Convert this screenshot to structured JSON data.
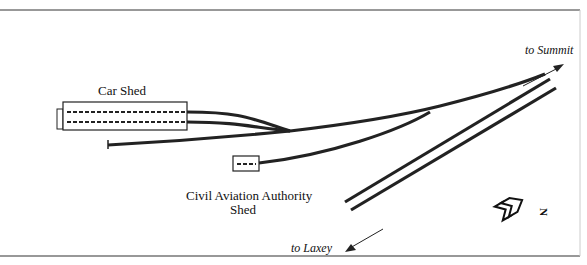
{
  "labels": {
    "car_shed": "Car Shed",
    "caa_shed_line1": "Civil Aviation Authority",
    "caa_shed_line2": "Shed",
    "to_summit": "to Summit",
    "to_laxey": "to Laxey",
    "north": "N"
  },
  "colors": {
    "track": "#222222",
    "border": "#333333"
  }
}
